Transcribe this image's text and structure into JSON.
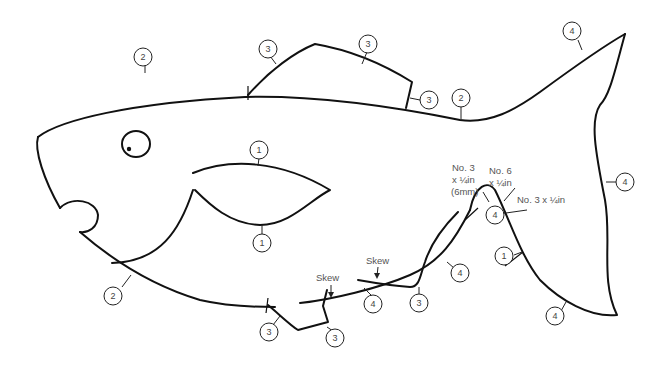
{
  "diagram": {
    "colors": {
      "line": "#111111",
      "label_text": "#555555",
      "background": "#ffffff"
    },
    "callouts": [
      {
        "id": "c-top-head",
        "label": "2"
      },
      {
        "id": "c-dorsal-left",
        "label": "3"
      },
      {
        "id": "c-dorsal-top",
        "label": "3"
      },
      {
        "id": "c-dorsal-right",
        "label": "3"
      },
      {
        "id": "c-back",
        "label": "2"
      },
      {
        "id": "c-tail-top",
        "label": "4"
      },
      {
        "id": "c-tail-right",
        "label": "4"
      },
      {
        "id": "c-pectoral-top",
        "label": "1"
      },
      {
        "id": "c-pectoral-bottom",
        "label": "1"
      },
      {
        "id": "c-belly",
        "label": "2"
      },
      {
        "id": "c-pelvic-left",
        "label": "3"
      },
      {
        "id": "c-pelvic-right",
        "label": "3"
      },
      {
        "id": "c-anal-belly",
        "label": "4"
      },
      {
        "id": "c-anal-fin",
        "label": "3"
      },
      {
        "id": "c-tail-root-lower",
        "label": "4"
      },
      {
        "id": "c-tail-peak",
        "label": "4"
      },
      {
        "id": "c-tail-inner",
        "label": "1"
      },
      {
        "id": "c-tail-bottom",
        "label": "4"
      }
    ],
    "notes": {
      "skew_left": "Skew",
      "skew_right": "Skew",
      "screw_a_line1": "No. 3",
      "screw_a_line2": "x ¼in",
      "screw_a_line3": "(6mm)",
      "screw_b_line1": "No. 6",
      "screw_b_line2": "x ¼in",
      "screw_c": "No. 3 x ¼in"
    }
  }
}
